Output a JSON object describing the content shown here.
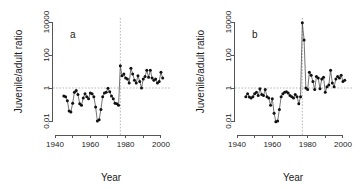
{
  "figure": {
    "background": "#ffffff",
    "point_color": "#111111",
    "line_color": "#3a3a3a",
    "axis_color": "#555555",
    "reference_color": "#9a9a9a"
  },
  "chart_data": [
    {
      "type": "line",
      "panel_label": "a",
      "title": "",
      "xlabel": "Year",
      "ylabel": "Juvenile/adult ratio",
      "yscale": "log",
      "ylim": [
        0.01,
        10000
      ],
      "ytick_values": [
        0.01,
        1,
        100,
        10000
      ],
      "ytick_labels": [
        "0.01",
        "1",
        "100",
        "10000"
      ],
      "xlim": [
        1940,
        2004
      ],
      "xtick_values": [
        1940,
        1950,
        1960,
        1970,
        1980,
        1990,
        2000
      ],
      "xtick_labels": [
        "1940",
        "",
        "1960",
        "",
        "1980",
        "",
        "2000"
      ],
      "grid": false,
      "legend": "none",
      "annotations": [
        {
          "kind": "hline",
          "value": 1,
          "style": "dashed"
        },
        {
          "kind": "vline",
          "value": 1977,
          "style": "dashed"
        }
      ],
      "x": [
        1945,
        1946,
        1947,
        1948,
        1949,
        1950,
        1951,
        1952,
        1953,
        1954,
        1955,
        1956,
        1957,
        1958,
        1959,
        1960,
        1961,
        1962,
        1963,
        1964,
        1965,
        1966,
        1967,
        1968,
        1969,
        1970,
        1971,
        1972,
        1973,
        1974,
        1975,
        1976,
        1977,
        1978,
        1979,
        1980,
        1981,
        1982,
        1983,
        1984,
        1985,
        1986,
        1987,
        1988,
        1989,
        1990,
        1991,
        1992,
        1993,
        1994,
        1995,
        1996,
        1997,
        1998,
        1999,
        2000,
        2001
      ],
      "values": [
        0.33,
        0.3,
        0.17,
        0.04,
        0.035,
        0.12,
        0.55,
        0.7,
        0.4,
        0.11,
        0.09,
        0.25,
        0.45,
        0.3,
        0.22,
        0.5,
        0.45,
        0.3,
        0.07,
        0.01,
        0.012,
        0.05,
        0.3,
        0.5,
        0.55,
        0.95,
        0.6,
        0.33,
        0.22,
        0.12,
        0.11,
        0.09,
        22.0,
        5.5,
        7.0,
        4.0,
        3.5,
        2.0,
        16.0,
        7.0,
        3.0,
        2.0,
        5.5,
        2.5,
        1.0,
        3.5,
        5.0,
        12.0,
        4.5,
        12.0,
        4.0,
        3.0,
        3.5,
        2.0,
        2.5,
        9.0,
        4.0
      ]
    },
    {
      "type": "line",
      "panel_label": "b",
      "title": "",
      "xlabel": "Year",
      "ylabel": "Juvenile/adult ratio",
      "yscale": "log",
      "ylim": [
        0.01,
        10000
      ],
      "ytick_values": [
        0.01,
        1,
        100,
        10000
      ],
      "ytick_labels": [
        "0.01",
        "1",
        "100",
        "10000"
      ],
      "xlim": [
        1940,
        2004
      ],
      "xtick_values": [
        1940,
        1950,
        1960,
        1970,
        1980,
        1990,
        2000
      ],
      "xtick_labels": [
        "1940",
        "",
        "1960",
        "",
        "1980",
        "",
        "2000"
      ],
      "grid": false,
      "legend": "none",
      "annotations": [
        {
          "kind": "hline",
          "value": 1,
          "style": "dashed"
        },
        {
          "kind": "vline",
          "value": 1977,
          "style": "dashed"
        }
      ],
      "x": [
        1945,
        1946,
        1947,
        1948,
        1949,
        1950,
        1951,
        1952,
        1953,
        1954,
        1955,
        1956,
        1957,
        1958,
        1959,
        1960,
        1961,
        1962,
        1963,
        1964,
        1965,
        1966,
        1967,
        1968,
        1969,
        1970,
        1971,
        1972,
        1973,
        1974,
        1975,
        1976,
        1977,
        1978,
        1979,
        1980,
        1981,
        1982,
        1983,
        1984,
        1985,
        1986,
        1987,
        1988,
        1989,
        1990,
        1991,
        1992,
        1993,
        1994,
        1995,
        1996,
        1997,
        1998,
        1999,
        2000,
        2001
      ],
      "values": [
        0.3,
        0.45,
        0.28,
        0.25,
        0.3,
        0.45,
        0.55,
        0.35,
        0.9,
        0.4,
        0.35,
        0.8,
        0.3,
        0.25,
        0.09,
        0.22,
        0.03,
        0.009,
        0.01,
        0.05,
        0.3,
        0.45,
        0.55,
        0.6,
        0.5,
        0.35,
        0.3,
        0.25,
        0.4,
        0.3,
        0.11,
        0.3,
        9000.0,
        800.0,
        1.0,
        0.8,
        9.0,
        6.0,
        2.5,
        0.8,
        5.0,
        4.0,
        0.9,
        3.5,
        4.5,
        0.55,
        1.2,
        1.5,
        12.0,
        2.0,
        1.2,
        3.5,
        5.0,
        4.0,
        6.0,
        2.5,
        3.0
      ]
    }
  ]
}
